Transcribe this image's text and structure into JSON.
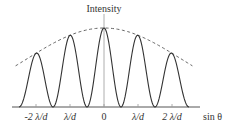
{
  "chart_data": {
    "type": "line",
    "title": "",
    "ylabel": "Intensity",
    "xlabel": "sin θ",
    "tick_labels": [
      "-2 λ/d",
      "λ/d",
      "0",
      "λ/d",
      "2 λ/d"
    ],
    "tick_values": [
      -2,
      -1,
      0,
      1,
      2
    ],
    "xlim": [
      -2.5,
      2.5
    ],
    "ylim": [
      0,
      1.05
    ],
    "series": [
      {
        "name": "interference-pattern",
        "style": "solid",
        "description": "cos² fringes with maxima at integer multiples of λ/d, modulated by envelope",
        "peaks": [
          {
            "x": -2,
            "y": 0.68
          },
          {
            "x": -1,
            "y": 0.92
          },
          {
            "x": 0,
            "y": 1.0
          },
          {
            "x": 1,
            "y": 0.92
          },
          {
            "x": 2,
            "y": 0.68
          }
        ],
        "zeros": [
          -2.5,
          -1.5,
          -0.5,
          0.5,
          1.5,
          2.5
        ]
      },
      {
        "name": "single-slit-envelope",
        "style": "dashed",
        "description": "diffraction envelope over the fringe maxima"
      }
    ],
    "grid": false,
    "legend": "none"
  },
  "colors": {
    "curve": "#333333",
    "envelope": "#666666",
    "axis": "#555555"
  }
}
